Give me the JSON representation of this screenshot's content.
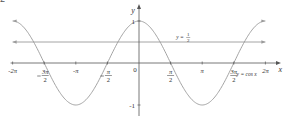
{
  "question_label": "2",
  "chart_data": {
    "type": "line",
    "title": "",
    "xlabel": "x",
    "ylabel": "y",
    "xlim": [
      "-2π",
      "2π"
    ],
    "ylim": [
      -1,
      1
    ],
    "grid": false,
    "x_ticks": [
      {
        "value": -6.2832,
        "label": "-2π"
      },
      {
        "value": -4.7124,
        "label": "-3π/2",
        "num": "3π",
        "den": "2",
        "neg": true
      },
      {
        "value": -3.1416,
        "label": "-π"
      },
      {
        "value": -1.5708,
        "label": "-π/2",
        "num": "π",
        "den": "2",
        "neg": true
      },
      {
        "value": 0,
        "label": "0"
      },
      {
        "value": 1.5708,
        "label": "π/2",
        "num": "π",
        "den": "2",
        "neg": false
      },
      {
        "value": 3.1416,
        "label": "π"
      },
      {
        "value": 4.7124,
        "label": "3π/2",
        "num": "3π",
        "den": "2",
        "neg": false
      },
      {
        "value": 6.2832,
        "label": "2π"
      }
    ],
    "y_ticks": [
      {
        "value": 1,
        "label": "1"
      },
      {
        "value": -1,
        "label": "-1"
      }
    ],
    "series": [
      {
        "name": "y = cos x",
        "function": "cos",
        "domain": [
          -6.2832,
          6.2832
        ],
        "color": "#9a9a9a"
      },
      {
        "name": "y = 1/2",
        "function": "constant",
        "value": 0.5,
        "domain": [
          -6.2832,
          6.2832
        ],
        "color": "#9a9a9a",
        "arrows": "both"
      }
    ],
    "annotations": [
      {
        "text": "y = cos x",
        "x": 4.85,
        "y": -0.32
      },
      {
        "text": "y = ½",
        "x": 1.85,
        "y": 0.56
      }
    ],
    "axis_labels": {
      "x": "x",
      "y": "y",
      "origin": "0"
    }
  }
}
